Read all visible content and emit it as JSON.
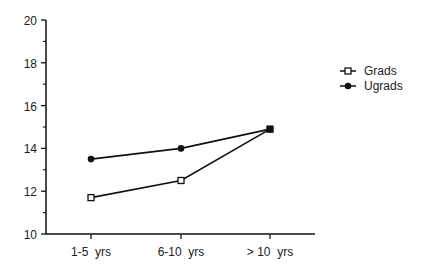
{
  "chart_data": {
    "type": "line",
    "title": "",
    "xlabel": "",
    "ylabel": "",
    "categories": [
      "1-5  yrs",
      "6-10  yrs",
      "> 10  yrs"
    ],
    "series": [
      {
        "name": "Grads",
        "marker": "open-square",
        "values": [
          11.7,
          12.5,
          14.9
        ]
      },
      {
        "name": "Ugrads",
        "marker": "filled-diamond",
        "values": [
          13.5,
          14.0,
          14.9
        ]
      }
    ],
    "ylim": [
      10,
      20
    ],
    "yticks": [
      10,
      12,
      14,
      16,
      18,
      20
    ],
    "yticks_minor": [
      11,
      13,
      15,
      17,
      19
    ],
    "grid": false,
    "legend_position": "right"
  },
  "legend": {
    "items": [
      {
        "label": "Grads"
      },
      {
        "label": "Ugrads"
      }
    ]
  },
  "colors": {
    "line": "#111111",
    "background": "#ffffff"
  }
}
